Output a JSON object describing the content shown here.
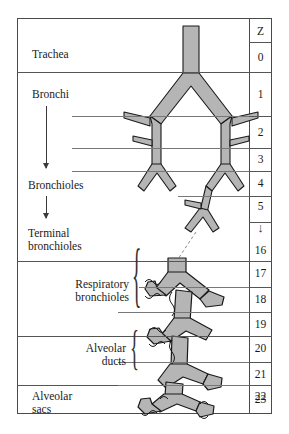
{
  "figure": {
    "column_header": "Z",
    "fill_color": "#b5b5b5",
    "stroke_color": "#1a1a1a",
    "rule_color": "#555555"
  },
  "generations": [
    {
      "label": "Z",
      "is_header": true,
      "top": 19,
      "bottom": 42
    },
    {
      "label": "0",
      "is_header": false,
      "top": 42,
      "bottom": 72
    },
    {
      "label": "1",
      "is_header": false,
      "top": 72,
      "bottom": 116
    },
    {
      "label": "2",
      "is_header": false,
      "top": 116,
      "bottom": 148
    },
    {
      "label": "3",
      "is_header": false,
      "top": 148,
      "bottom": 171
    },
    {
      "label": "4",
      "is_header": false,
      "top": 171,
      "bottom": 196
    },
    {
      "label": "5",
      "is_header": false,
      "top": 196,
      "bottom": 222
    },
    {
      "label": "16",
      "is_header": false,
      "top": 222,
      "bottom": 261
    },
    {
      "label": "17",
      "is_header": false,
      "top": 261,
      "bottom": 287
    },
    {
      "label": "18",
      "is_header": false,
      "top": 287,
      "bottom": 312
    },
    {
      "label": "19",
      "is_header": false,
      "top": 312,
      "bottom": 336
    },
    {
      "label": "20",
      "is_header": false,
      "top": 336,
      "bottom": 362
    },
    {
      "label": "21",
      "is_header": false,
      "top": 362,
      "bottom": 385
    },
    {
      "label": "22",
      "is_header": false,
      "top": 385,
      "bottom": 413
    },
    {
      "label": "23",
      "is_header": false,
      "top": 413,
      "bottom": 413
    }
  ],
  "z_arrow": "↓",
  "regions": [
    {
      "name": "trachea",
      "label": "Trachea"
    },
    {
      "name": "bronchi",
      "label": "Bronchi"
    },
    {
      "name": "bronchioles",
      "label": "Bronchioles"
    },
    {
      "name": "terminal-bronchioles",
      "label": "Terminal\nbronchioles"
    },
    {
      "name": "respiratory-bronchioles",
      "label": "Respiratory\nbronchioles"
    },
    {
      "name": "alveolar-ducts",
      "label": "Alveolar\nducts"
    },
    {
      "name": "alveolar-sacs",
      "label": "Alveolar\nsacs"
    }
  ],
  "zones": [
    {
      "name": "conducting-zone",
      "label": ""
    },
    {
      "name": "transitional-zone",
      "label": ""
    }
  ]
}
